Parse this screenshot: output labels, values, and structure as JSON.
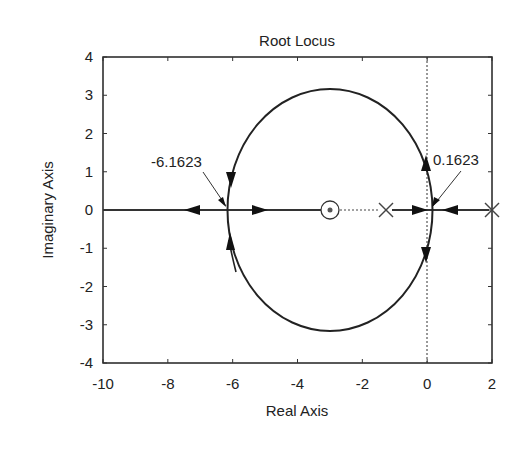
{
  "chart_data": {
    "type": "line",
    "subtype": "root-locus",
    "title": "Root Locus",
    "xlabel": "Real Axis",
    "ylabel": "Imaginary Axis",
    "xlim": [
      -10,
      2
    ],
    "ylim": [
      -4,
      4
    ],
    "xticks": [
      -10,
      -8,
      -6,
      -4,
      -2,
      0,
      2
    ],
    "yticks": [
      -4,
      -3,
      -2,
      -1,
      0,
      1,
      2,
      3,
      4
    ],
    "grid": false,
    "legend": null,
    "poles": [
      {
        "re": -1.3,
        "im": 0
      },
      {
        "re": 2,
        "im": 0
      }
    ],
    "zeros": [
      {
        "re": -3,
        "im": 0
      }
    ],
    "breakpoints": [
      {
        "re": -6.1623,
        "im": 0,
        "label": "-6.1623"
      },
      {
        "re": 0.1623,
        "im": 0,
        "label": "0.1623"
      }
    ],
    "locus_circle": {
      "center_re": -3,
      "center_im": 0,
      "radius": 3.1623
    },
    "real_axis_segments": [
      {
        "from": -10,
        "to": -3
      },
      {
        "from": -1.3,
        "to": 2
      }
    ],
    "imaginary_axis_reference": {
      "re": 0,
      "style": "dotted"
    },
    "annotations": [
      "-6.1623",
      "0.1623"
    ]
  }
}
